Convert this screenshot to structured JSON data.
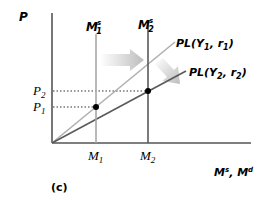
{
  "diagram": {
    "panel_label": "(c)",
    "y_axis_label": "P",
    "x_axis_label": "Ms, Md",
    "x_axis_label_parts": {
      "base1": "M",
      "sup1": "s",
      "sep": ", ",
      "base2": "M",
      "sup2": "d"
    },
    "supply_lines": [
      {
        "label_base": "M",
        "label_sup": "s",
        "label_sub": "1",
        "tick_label_base": "M",
        "tick_label_sub": "1",
        "color": "#a8a8a8"
      },
      {
        "label_base": "M",
        "label_sup": "s",
        "label_sub": "2",
        "tick_label_base": "M",
        "tick_label_sub": "2",
        "color": "#5a5a5a"
      }
    ],
    "demand_lines": [
      {
        "label": "PL(Y1, r1)",
        "label_pre": "PL(Y",
        "sub_a": "1",
        "mid": ", r",
        "sub_b": "1",
        "post": ")",
        "color": "#b0b0b0"
      },
      {
        "label": "PL(Y2, r2)",
        "label_pre": "PL(Y",
        "sub_a": "2",
        "mid": ", r",
        "sub_b": "2",
        "post": ")",
        "color": "#5a5a5a"
      }
    ],
    "price_levels": [
      {
        "label_base": "P",
        "label_sub": "1"
      },
      {
        "label_base": "P",
        "label_sub": "2"
      }
    ],
    "arrows": [
      {
        "name": "shift-right-arrow",
        "direction": "right"
      },
      {
        "name": "shift-down-arrow",
        "direction": "down-right"
      }
    ],
    "colors": {
      "axis": "#555555",
      "dotted": "#333333",
      "point": "#000000",
      "arrow": "#c8c8c8"
    }
  }
}
